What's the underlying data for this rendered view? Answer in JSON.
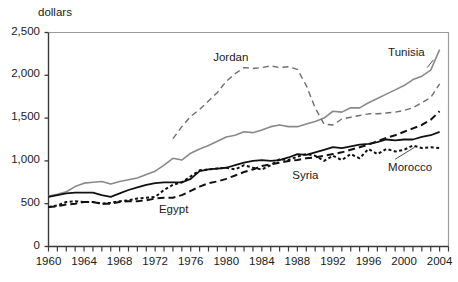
{
  "chart_data": {
    "type": "line",
    "title": "",
    "subtitle": "",
    "xlabel": "",
    "ylabel": "dollars",
    "xlim": [
      1960,
      2005
    ],
    "ylim": [
      0,
      2500
    ],
    "grid": false,
    "legend_position": "inline-annotations",
    "y_ticks": [
      "0",
      "500",
      "1,000",
      "1,500",
      "2,000",
      "2,500"
    ],
    "y_tick_values": [
      0,
      500,
      1000,
      1500,
      2000,
      2500
    ],
    "x_ticks": [
      "1960",
      "1964",
      "1968",
      "1972",
      "1976",
      "1980",
      "1984",
      "1988",
      "1992",
      "1996",
      "2000",
      "2004"
    ],
    "x_tick_values": [
      1960,
      1964,
      1968,
      1972,
      1976,
      1980,
      1984,
      1988,
      1992,
      1996,
      2000,
      2004
    ],
    "x_minor_tick_step": 1,
    "x": [
      1960,
      1961,
      1962,
      1963,
      1964,
      1965,
      1966,
      1967,
      1968,
      1969,
      1970,
      1971,
      1972,
      1973,
      1974,
      1975,
      1976,
      1977,
      1978,
      1979,
      1980,
      1981,
      1982,
      1983,
      1984,
      1985,
      1986,
      1987,
      1988,
      1989,
      1990,
      1991,
      1992,
      1993,
      1994,
      1995,
      1996,
      1997,
      1998,
      1999,
      2000,
      2001,
      2002,
      2003,
      2004
    ],
    "series": [
      {
        "name": "Tunisia",
        "style": "solid",
        "color": "#8a8a8a",
        "width": 1.6,
        "label_x": 2000,
        "label_y": 2250,
        "values": [
          590,
          610,
          640,
          700,
          740,
          750,
          760,
          730,
          760,
          780,
          800,
          840,
          880,
          950,
          1030,
          1010,
          1090,
          1140,
          1180,
          1230,
          1280,
          1300,
          1340,
          1330,
          1360,
          1400,
          1420,
          1400,
          1400,
          1430,
          1460,
          1500,
          1580,
          1570,
          1620,
          1620,
          1680,
          1730,
          1780,
          1830,
          1880,
          1950,
          1990,
          2060,
          2300
        ]
      },
      {
        "name": "Jordan",
        "style": "longdash",
        "color": "#6e6e6e",
        "width": 1.4,
        "label_x": 1981,
        "label_y": 2180,
        "values": [
          null,
          null,
          null,
          null,
          null,
          null,
          null,
          null,
          null,
          null,
          null,
          null,
          null,
          null,
          1260,
          1400,
          1520,
          1600,
          1700,
          1800,
          1930,
          2020,
          2090,
          2080,
          2090,
          2110,
          2090,
          2100,
          2070,
          1880,
          1620,
          1430,
          1420,
          1490,
          1510,
          1530,
          1550,
          1550,
          1560,
          1570,
          1590,
          1620,
          1680,
          1740,
          1900
        ]
      },
      {
        "name": "Egypt",
        "style": "dash",
        "color": "#111111",
        "width": 2.0,
        "label_x": 1974,
        "label_y": 430,
        "values": [
          460,
          470,
          490,
          500,
          520,
          520,
          500,
          500,
          520,
          530,
          530,
          540,
          560,
          570,
          570,
          600,
          650,
          700,
          740,
          760,
          790,
          830,
          870,
          900,
          940,
          960,
          980,
          1000,
          1010,
          1030,
          1040,
          1060,
          1080,
          1100,
          1130,
          1160,
          1190,
          1230,
          1270,
          1300,
          1340,
          1380,
          1420,
          1480,
          1580
        ]
      },
      {
        "name": "Syria",
        "style": "solid",
        "color": "#111111",
        "width": 1.8,
        "label_x": 1989,
        "label_y": 820,
        "values": [
          580,
          600,
          620,
          630,
          630,
          630,
          600,
          580,
          620,
          660,
          690,
          720,
          740,
          750,
          750,
          750,
          790,
          880,
          900,
          910,
          920,
          950,
          980,
          1000,
          1010,
          1000,
          1010,
          1040,
          1080,
          1070,
          1100,
          1130,
          1160,
          1150,
          1170,
          1190,
          1200,
          1220,
          1250,
          1240,
          1250,
          1250,
          1280,
          1300,
          1340
        ]
      },
      {
        "name": "Morocco",
        "style": "dotted",
        "color": "#111111",
        "width": 2.0,
        "label_x": 2000,
        "label_y": 930,
        "values": [
          460,
          480,
          520,
          530,
          520,
          520,
          500,
          510,
          530,
          540,
          560,
          570,
          580,
          660,
          720,
          750,
          820,
          890,
          900,
          910,
          920,
          900,
          950,
          920,
          900,
          950,
          1020,
          1010,
          1050,
          1080,
          1060,
          1000,
          1060,
          1010,
          1080,
          1030,
          1140,
          1080,
          1140,
          1110,
          1130,
          1180,
          1150,
          1160,
          1150
        ]
      }
    ]
  },
  "annotations": {
    "tunisia": "Tunisia",
    "jordan": "Jordan",
    "egypt": "Egypt",
    "syria": "Syria",
    "morocco": "Morocco"
  },
  "y_axis_unit": "dollars"
}
